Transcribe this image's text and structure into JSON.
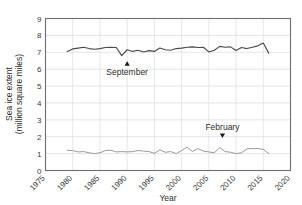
{
  "chart_data": {
    "type": "line",
    "title": "",
    "xlabel": "Year",
    "ylabel": "Sea ice extent (million square miles)",
    "ylabel_line1": "Sea ice extent",
    "ylabel_line2": "(million square miles)",
    "xlim": [
      1975,
      2020
    ],
    "ylim": [
      0,
      9
    ],
    "xticks": [
      "1975",
      "1980",
      "1985",
      "1990",
      "1995",
      "2000",
      "2005",
      "2010",
      "2015",
      "2020"
    ],
    "yticks": [
      "0",
      "1",
      "2",
      "3",
      "4",
      "5",
      "6",
      "7",
      "8",
      "9"
    ],
    "grid": "horizontal-and-vertical",
    "legend_position": "inline-annotations",
    "annotations": [
      {
        "name": "september-annotation",
        "label": "September",
        "arrow": "up",
        "x": 1990,
        "y": 6.2
      },
      {
        "name": "february-annotation",
        "label": "February",
        "arrow": "down",
        "x": 2007.5,
        "y": 2.4
      }
    ],
    "series": [
      {
        "name": "September",
        "color": "#4a4a4a",
        "x": [
          1979,
          1980,
          1981,
          1982,
          1983,
          1984,
          1985,
          1986,
          1987,
          1988,
          1989,
          1990,
          1991,
          1992,
          1993,
          1994,
          1995,
          1996,
          1997,
          1998,
          1999,
          2000,
          2001,
          2002,
          2003,
          2004,
          2005,
          2006,
          2007,
          2008,
          2009,
          2010,
          2011,
          2012,
          2013,
          2014,
          2015,
          2016
        ],
        "values": [
          7.05,
          7.2,
          7.25,
          7.3,
          7.22,
          7.18,
          7.22,
          7.28,
          7.3,
          7.28,
          6.8,
          7.15,
          7.05,
          7.12,
          7.02,
          7.1,
          7.05,
          7.25,
          7.15,
          7.12,
          7.22,
          7.25,
          7.3,
          7.32,
          7.28,
          7.3,
          7.02,
          7.12,
          7.35,
          7.3,
          7.32,
          7.1,
          7.28,
          7.22,
          7.3,
          7.38,
          7.55,
          6.95
        ]
      },
      {
        "name": "February",
        "color": "#9a9a9a",
        "x": [
          1979,
          1980,
          1981,
          1982,
          1983,
          1984,
          1985,
          1986,
          1987,
          1988,
          1989,
          1990,
          1991,
          1992,
          1993,
          1994,
          1995,
          1996,
          1997,
          1998,
          1999,
          2000,
          2001,
          2002,
          2003,
          2004,
          2005,
          2006,
          2007,
          2008,
          2009,
          2010,
          2011,
          2012,
          2013,
          2014,
          2015,
          2016
        ],
        "values": [
          1.2,
          1.18,
          1.1,
          1.12,
          1.05,
          1.0,
          1.05,
          1.18,
          1.2,
          1.1,
          1.12,
          1.1,
          1.12,
          1.18,
          1.15,
          1.12,
          1.02,
          1.22,
          1.08,
          1.12,
          1.0,
          1.18,
          1.38,
          1.12,
          1.3,
          1.15,
          1.1,
          1.05,
          1.35,
          1.12,
          1.08,
          1.0,
          1.05,
          1.28,
          1.3,
          1.3,
          1.25,
          1.0
        ]
      }
    ]
  }
}
